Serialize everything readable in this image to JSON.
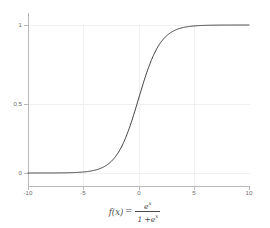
{
  "figure": {
    "background_color": "#ffffff",
    "curve_color": "#3c3c3c",
    "grid_color": "#f0f0f0",
    "axis_color": "#b8b8b8",
    "tick_label_color": "#6e6e6e",
    "caption_color": "#4a4a4a"
  },
  "caption": {
    "function_name": "f",
    "variable": "x",
    "lhs_open": "(",
    "lhs_close": ")",
    "equals": "=",
    "numerator_base": "e",
    "numerator_exponent": "x",
    "denominator_one": "1 +",
    "denominator_base": "e",
    "denominator_exponent": "x",
    "plain": "f(x) = e^x / (1 + e^x)"
  },
  "chart_data": {
    "type": "line",
    "title": "",
    "subtitle": "",
    "xlabel": "f(x) = e^x / (1 + e^x)",
    "ylabel": "",
    "xlim": [
      -10,
      10
    ],
    "ylim": [
      0,
      1
    ],
    "grid": true,
    "legend": null,
    "xticks": [
      -10,
      -5,
      0,
      5,
      10
    ],
    "xtick_labels": [
      "-10",
      "-5",
      "0",
      "5",
      "10"
    ],
    "yticks": [
      0,
      0.5,
      1
    ],
    "ytick_labels": [
      "0",
      "0.5",
      "1"
    ],
    "series": [
      {
        "name": "logistic sigmoid",
        "color": "#3c3c3c",
        "linewidth": 1,
        "x": [
          -10,
          -9.5,
          -9,
          -8.5,
          -8,
          -7.5,
          -7,
          -6.5,
          -6,
          -5.5,
          -5,
          -4.5,
          -4,
          -3.5,
          -3,
          -2.5,
          -2,
          -1.5,
          -1,
          -0.5,
          0,
          0.5,
          1,
          1.5,
          2,
          2.5,
          3,
          3.5,
          4,
          4.5,
          5,
          5.5,
          6,
          6.5,
          7,
          7.5,
          8,
          8.5,
          9,
          9.5,
          10
        ],
        "y": [
          4.54e-05,
          7.49e-05,
          0.0001234,
          0.0002034,
          0.0003354,
          0.0005527,
          0.0009111,
          0.0015012,
          0.0024726,
          0.0040701,
          0.0066929,
          0.0109869,
          0.0179862,
          0.0293122,
          0.0474259,
          0.0758582,
          0.1192029,
          0.1824255,
          0.2689414,
          0.3775407,
          0.5,
          0.6224593,
          0.7310586,
          0.8175745,
          0.8807971,
          0.9241418,
          0.9525741,
          0.9706878,
          0.9820138,
          0.9890131,
          0.9933071,
          0.9959299,
          0.9975274,
          0.9984988,
          0.9990889,
          0.9994473,
          0.9996646,
          0.9997966,
          0.9998766,
          0.9999251,
          0.9999546
        ]
      }
    ]
  }
}
